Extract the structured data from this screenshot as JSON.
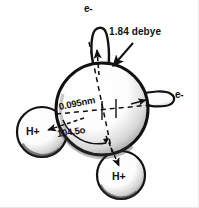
{
  "figure": {
    "background_color": "#ffffff",
    "ink_color": "#111111"
  },
  "labels": {
    "electron_top": "e-",
    "electron_right": "e-",
    "dipole_moment": "1.84 debye",
    "bond_length": "0.095nm",
    "bond_angle": "104.5o",
    "hydrogen_left": "H+",
    "hydrogen_bottom": "H+"
  },
  "parts": {
    "oxygen_sphere": "oxygen-atom-sphere",
    "lobe_top": "lone-pair-lobe-top",
    "lobe_right": "lone-pair-lobe-right",
    "hydrogen_left": "hydrogen-sphere-left",
    "hydrogen_bottom": "hydrogen-sphere-bottom",
    "pointer_arrow": "dipole-pointer-arrow",
    "angle_arc": "bond-angle-arc",
    "axis_vertical": "dipole-axis-dashed",
    "axis_horizontal": "horizontal-axis-dashed"
  },
  "geometry": {
    "oxygen_center_x": 102,
    "oxygen_center_y": 109,
    "oxygen_radius": 46,
    "hydrogen_left_center_x": 42,
    "hydrogen_left_center_y": 132,
    "hydrogen_left_radius": 25,
    "hydrogen_bottom_center_x": 121,
    "hydrogen_bottom_center_y": 175,
    "hydrogen_bottom_radius": 24,
    "bond_angle_degrees": 104.5,
    "bond_length_nm": 0.095,
    "dipole_moment_debye": 1.84
  }
}
